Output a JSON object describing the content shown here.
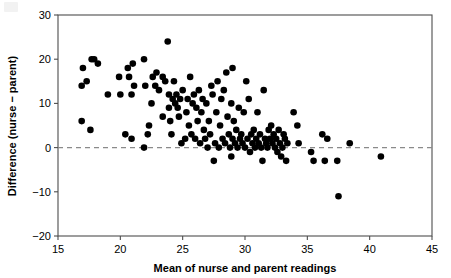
{
  "chart_data": {
    "type": "scatter",
    "title": "",
    "xlabel": "Mean of nurse and parent readings",
    "ylabel": "Difference (nurse − parent)",
    "xlim": [
      15,
      45
    ],
    "ylim": [
      -20,
      30
    ],
    "xticks": [
      15,
      20,
      25,
      30,
      35,
      40,
      45
    ],
    "yticks": [
      30,
      20,
      10,
      0,
      -10,
      -20
    ],
    "xtick_labels": [
      "15",
      "20",
      "25",
      "30",
      "35",
      "40",
      "45"
    ],
    "ytick_labels": [
      "30",
      "20",
      "10",
      "0",
      "−10",
      "−20"
    ],
    "grid": false,
    "legend": false,
    "reference_lines": [
      {
        "name": "zero-line",
        "orientation": "horizontal",
        "y": 0,
        "style": "dashed",
        "color": "#8a8a8a"
      }
    ],
    "marker": {
      "shape": "circle",
      "color": "#000000",
      "size": 4.6
    },
    "points": [
      [
        16.9,
        6
      ],
      [
        16.9,
        14
      ],
      [
        17.0,
        18
      ],
      [
        17.3,
        15
      ],
      [
        17.6,
        4
      ],
      [
        17.7,
        20
      ],
      [
        17.9,
        20
      ],
      [
        18.2,
        19
      ],
      [
        19.0,
        12
      ],
      [
        19.9,
        16
      ],
      [
        20.0,
        12
      ],
      [
        20.4,
        3
      ],
      [
        20.6,
        18
      ],
      [
        20.7,
        16
      ],
      [
        20.9,
        2
      ],
      [
        20.9,
        12
      ],
      [
        21.0,
        19
      ],
      [
        21.1,
        14
      ],
      [
        21.9,
        0
      ],
      [
        21.9,
        20
      ],
      [
        22.0,
        14
      ],
      [
        22.2,
        3
      ],
      [
        22.3,
        5
      ],
      [
        22.5,
        10
      ],
      [
        22.6,
        16
      ],
      [
        22.8,
        14
      ],
      [
        22.9,
        17
      ],
      [
        23.1,
        13
      ],
      [
        23.4,
        7
      ],
      [
        23.4,
        16
      ],
      [
        23.6,
        15
      ],
      [
        23.8,
        24
      ],
      [
        23.9,
        9
      ],
      [
        23.9,
        12
      ],
      [
        24.0,
        6
      ],
      [
        24.1,
        3
      ],
      [
        24.2,
        11
      ],
      [
        24.3,
        15
      ],
      [
        24.4,
        10
      ],
      [
        24.5,
        12
      ],
      [
        24.6,
        9
      ],
      [
        24.7,
        7
      ],
      [
        24.8,
        11
      ],
      [
        24.9,
        1
      ],
      [
        25.0,
        13
      ],
      [
        25.2,
        2
      ],
      [
        25.3,
        8
      ],
      [
        25.4,
        11
      ],
      [
        25.5,
        5
      ],
      [
        25.6,
        16
      ],
      [
        25.7,
        3
      ],
      [
        25.8,
        10
      ],
      [
        25.9,
        12
      ],
      [
        26.0,
        2
      ],
      [
        26.1,
        9
      ],
      [
        26.2,
        6
      ],
      [
        26.3,
        13
      ],
      [
        26.4,
        1
      ],
      [
        26.5,
        8
      ],
      [
        26.6,
        11
      ],
      [
        26.7,
        4
      ],
      [
        26.8,
        2
      ],
      [
        26.9,
        10
      ],
      [
        27.0,
        0
      ],
      [
        27.1,
        6
      ],
      [
        27.2,
        3
      ],
      [
        27.3,
        14
      ],
      [
        27.4,
        12
      ],
      [
        27.5,
        -3
      ],
      [
        27.6,
        1
      ],
      [
        27.7,
        8
      ],
      [
        27.8,
        15
      ],
      [
        27.9,
        0
      ],
      [
        28.0,
        5
      ],
      [
        28.1,
        11
      ],
      [
        28.2,
        2
      ],
      [
        28.3,
        13
      ],
      [
        28.4,
        1
      ],
      [
        28.5,
        17
      ],
      [
        28.6,
        7
      ],
      [
        28.7,
        3
      ],
      [
        28.8,
        0
      ],
      [
        28.9,
        10
      ],
      [
        28.9,
        -2
      ],
      [
        29.0,
        2
      ],
      [
        29.0,
        18
      ],
      [
        29.1,
        6
      ],
      [
        29.2,
        1
      ],
      [
        29.3,
        4
      ],
      [
        29.4,
        0
      ],
      [
        29.5,
        9
      ],
      [
        29.6,
        2
      ],
      [
        29.7,
        3
      ],
      [
        29.8,
        1
      ],
      [
        29.9,
        8
      ],
      [
        30.0,
        0
      ],
      [
        30.1,
        15
      ],
      [
        30.2,
        2
      ],
      [
        30.3,
        11
      ],
      [
        30.4,
        -1
      ],
      [
        30.5,
        3
      ],
      [
        30.6,
        1
      ],
      [
        30.7,
        4
      ],
      [
        30.8,
        0
      ],
      [
        30.9,
        2
      ],
      [
        31.0,
        8
      ],
      [
        31.1,
        1
      ],
      [
        31.2,
        3
      ],
      [
        31.3,
        0
      ],
      [
        31.4,
        -3
      ],
      [
        31.5,
        13
      ],
      [
        31.6,
        2
      ],
      [
        31.7,
        1
      ],
      [
        31.8,
        0
      ],
      [
        31.9,
        4
      ],
      [
        32.0,
        2
      ],
      [
        32.1,
        5
      ],
      [
        32.2,
        1
      ],
      [
        32.3,
        3
      ],
      [
        32.4,
        0
      ],
      [
        32.5,
        2
      ],
      [
        32.6,
        -1
      ],
      [
        32.7,
        4
      ],
      [
        32.8,
        1
      ],
      [
        32.9,
        -2
      ],
      [
        33.0,
        0
      ],
      [
        33.1,
        3
      ],
      [
        33.2,
        2
      ],
      [
        33.3,
        -3
      ],
      [
        33.4,
        1
      ],
      [
        33.9,
        8
      ],
      [
        34.2,
        5
      ],
      [
        34.3,
        1
      ],
      [
        35.3,
        -1
      ],
      [
        35.5,
        -3
      ],
      [
        36.2,
        3
      ],
      [
        36.4,
        -3
      ],
      [
        36.6,
        2
      ],
      [
        37.4,
        -3
      ],
      [
        37.5,
        -11
      ],
      [
        38.4,
        1
      ],
      [
        40.9,
        -2
      ]
    ]
  },
  "axis_titles": {
    "x": "Mean of nurse and parent readings",
    "y": "Difference (nurse − parent)"
  }
}
